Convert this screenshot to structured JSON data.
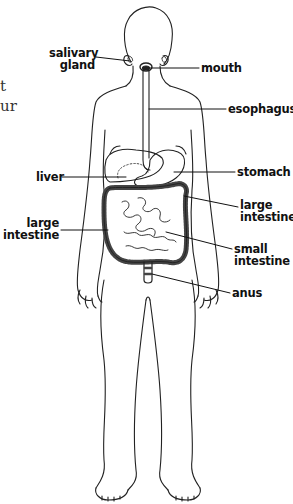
{
  "diagram": {
    "text_fragments": [
      "t",
      "ur"
    ],
    "labels": {
      "salivary_gland": [
        "salivary",
        "gland"
      ],
      "mouth": "mouth",
      "esophagus": "esophagus",
      "liver": "liver",
      "stomach": "stomach",
      "large_intestine_right": [
        "large",
        "intestine"
      ],
      "large_intestine_left": [
        "large",
        "intestine"
      ],
      "small_intestine": [
        "small",
        "intestine"
      ],
      "anus": "anus"
    },
    "colors": {
      "line": "#222222",
      "text": "#111111",
      "background": "#ffffff"
    }
  }
}
